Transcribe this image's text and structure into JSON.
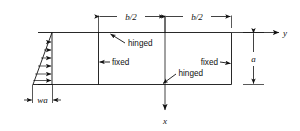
{
  "figure": {
    "type": "engineering-diagram",
    "dimensions": {
      "half_span_left": "b/2",
      "half_span_right": "b/2",
      "height": "a",
      "load_intensity": "wa"
    },
    "axes": {
      "horizontal_label": "y",
      "vertical_label": "x"
    },
    "supports": {
      "top_edge": "hinged",
      "bottom_edge": "hinged",
      "left_edge": "fixed",
      "right_edge": "fixed"
    },
    "colors": {
      "line": "#111111",
      "background": "#ffffff"
    }
  }
}
